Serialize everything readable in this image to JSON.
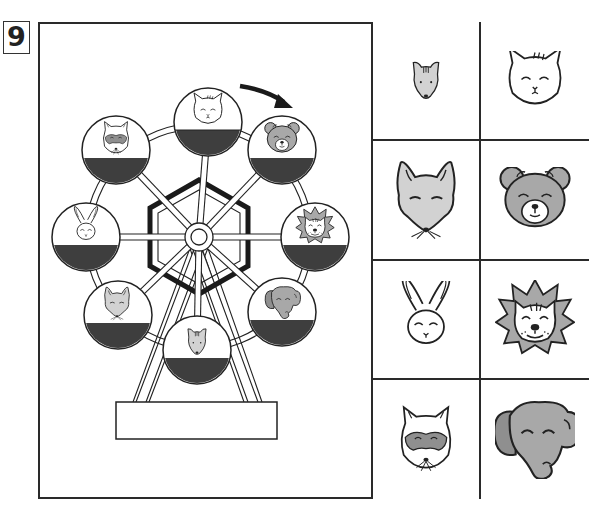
{
  "question": {
    "number": "9",
    "instruction_visible": false
  },
  "ferris_wheel": {
    "rotation_direction": "clockwise",
    "arrow_icon": "curved-arrow-clockwise",
    "gondolas": [
      {
        "position": "top",
        "animal": "cat"
      },
      {
        "position": "top-right",
        "animal": "bear"
      },
      {
        "position": "right",
        "animal": "lion"
      },
      {
        "position": "bottom-right",
        "animal": "elephant"
      },
      {
        "position": "bottom",
        "animal": "chipmunk"
      },
      {
        "position": "bottom-left",
        "animal": "fox"
      },
      {
        "position": "left",
        "animal": "rabbit"
      },
      {
        "position": "top-left",
        "animal": "raccoon"
      }
    ],
    "base_label": ""
  },
  "answer_grid": {
    "columns": 2,
    "rows": 4,
    "cells": [
      {
        "row": 1,
        "col": 1,
        "animal": "chipmunk"
      },
      {
        "row": 1,
        "col": 2,
        "animal": "cat"
      },
      {
        "row": 2,
        "col": 1,
        "animal": "fox"
      },
      {
        "row": 2,
        "col": 2,
        "animal": "bear"
      },
      {
        "row": 3,
        "col": 1,
        "animal": "rabbit"
      },
      {
        "row": 3,
        "col": 2,
        "animal": "lion"
      },
      {
        "row": 4,
        "col": 1,
        "animal": "raccoon"
      },
      {
        "row": 4,
        "col": 2,
        "animal": "elephant"
      }
    ]
  },
  "colors": {
    "line": "#2a2a2a",
    "gondola_floor": "#3e3e3e",
    "fur_light": "#d2d2d2",
    "fur_mid": "#a8a8a8",
    "fur_dark": "#8f8f8f",
    "background": "#ffffff"
  }
}
